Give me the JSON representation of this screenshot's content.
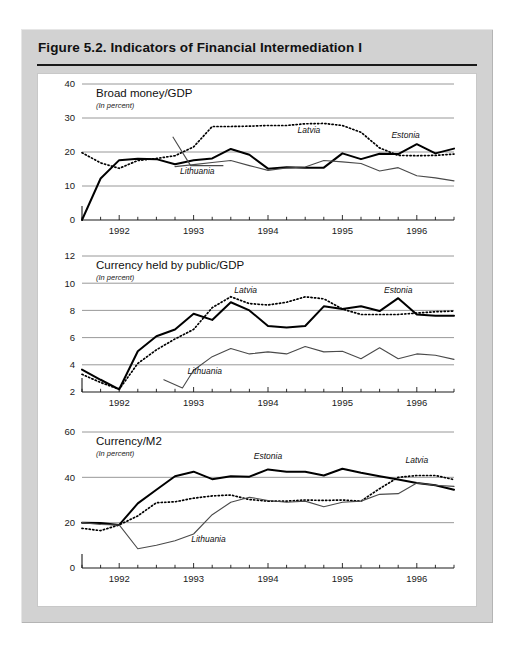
{
  "figure": {
    "title": "Figure 5.2.  Indicators of Financial Intermediation I"
  },
  "chart_data": [
    {
      "type": "line",
      "title": "Broad money/GDP",
      "subtitle": "(In percent)",
      "xlabel": "",
      "ylabel": "",
      "ylim": [
        0,
        40
      ],
      "yticks": [
        0,
        10,
        20,
        30,
        40
      ],
      "ytick_labels": [
        "0",
        "10",
        "20",
        "30",
        "40"
      ],
      "xlim": [
        1991.5,
        1996.5
      ],
      "xticks": [
        1992,
        1993,
        1994,
        1995,
        1996
      ],
      "xtick_labels": [
        "1992",
        "1993",
        "1994",
        "1995",
        "1996"
      ],
      "minor_xticks_per_year": 4,
      "grid": true,
      "legend_position": "inline-annotations",
      "annotations": [
        {
          "text": "Latvia",
          "x": 1994.55,
          "y": 25.6
        },
        {
          "text": "Estonia",
          "x": 1995.85,
          "y": 24.0
        },
        {
          "text": "Lithuania",
          "x": 1993.05,
          "y": 13.6
        }
      ],
      "series": [
        {
          "name": "Estonia",
          "style": "solid-thick",
          "x": [
            1991.5,
            1991.75,
            1992.0,
            1992.25,
            1992.5,
            1992.75,
            1993.0,
            1993.25,
            1993.5,
            1993.75,
            1994.0,
            1994.25,
            1994.5,
            1994.75,
            1995.0,
            1995.25,
            1995.5,
            1995.75,
            1996.0,
            1996.25,
            1996.5
          ],
          "y": [
            0.0,
            12.2,
            17.6,
            18.0,
            17.9,
            16.4,
            17.6,
            18.1,
            20.9,
            19.2,
            15.1,
            15.5,
            15.4,
            15.4,
            19.6,
            17.9,
            19.5,
            19.4,
            22.3,
            19.6,
            21.0
          ]
        },
        {
          "name": "Latvia",
          "style": "dotted",
          "x": [
            1991.5,
            1991.75,
            1992.0,
            1992.25,
            1992.5,
            1992.75,
            1993.0,
            1993.25,
            1993.5,
            1993.75,
            1994.0,
            1994.25,
            1994.5,
            1994.75,
            1995.0,
            1995.25,
            1995.5,
            1995.75,
            1996.0,
            1996.25,
            1996.5
          ],
          "y": [
            19.8,
            16.8,
            15.2,
            17.5,
            18.1,
            18.9,
            21.5,
            27.5,
            27.5,
            27.6,
            27.8,
            27.8,
            28.3,
            28.4,
            27.8,
            25.8,
            21.2,
            19.0,
            18.9,
            19.0,
            19.4
          ]
        },
        {
          "name": "Lithuania",
          "style": "solid-thin",
          "x": [
            1992.75,
            1993.0,
            1993.25,
            1993.5,
            1993.75,
            1994.0,
            1994.25,
            1994.5,
            1994.75,
            1995.0,
            1995.25,
            1995.5,
            1995.75,
            1996.0,
            1996.25,
            1996.5
          ],
          "y": [
            15.7,
            16.3,
            16.9,
            17.5,
            16.0,
            14.6,
            15.3,
            15.6,
            17.5,
            17.1,
            16.6,
            14.4,
            15.4,
            13.0,
            12.4,
            11.5
          ]
        }
      ]
    },
    {
      "type": "line",
      "title": "Currency held by public/GDP",
      "subtitle": "(In percent)",
      "xlabel": "",
      "ylabel": "",
      "ylim": [
        2,
        12
      ],
      "yticks": [
        2,
        4,
        6,
        8,
        10,
        12
      ],
      "ytick_labels": [
        "2",
        "4",
        "6",
        "8",
        "10",
        "12"
      ],
      "xlim": [
        1991.5,
        1996.5
      ],
      "xticks": [
        1992,
        1993,
        1994,
        1995,
        1996
      ],
      "xtick_labels": [
        "1992",
        "1993",
        "1994",
        "1995",
        "1996"
      ],
      "minor_xticks_per_year": 4,
      "grid": true,
      "legend_position": "inline-annotations",
      "annotations": [
        {
          "text": "Latvia",
          "x": 1993.7,
          "y": 9.25
        },
        {
          "text": "Estonia",
          "x": 1995.75,
          "y": 9.3
        },
        {
          "text": "Lithuania",
          "x": 1993.15,
          "y": 3.3
        }
      ],
      "series": [
        {
          "name": "Estonia",
          "style": "solid-thick",
          "x": [
            1991.5,
            1991.75,
            1992.0,
            1992.25,
            1992.5,
            1992.75,
            1993.0,
            1993.25,
            1993.5,
            1993.75,
            1994.0,
            1994.25,
            1994.5,
            1994.75,
            1995.0,
            1995.25,
            1995.5,
            1995.75,
            1996.0,
            1996.25,
            1996.5
          ],
          "y": [
            3.65,
            2.9,
            2.2,
            5.0,
            6.1,
            6.6,
            7.75,
            7.3,
            8.6,
            8.0,
            6.85,
            6.75,
            6.85,
            8.3,
            8.1,
            8.3,
            7.95,
            8.9,
            7.7,
            7.6,
            7.6
          ]
        },
        {
          "name": "Latvia",
          "style": "dotted",
          "x": [
            1991.5,
            1991.75,
            1992.0,
            1992.25,
            1992.5,
            1992.75,
            1993.0,
            1993.25,
            1993.5,
            1993.75,
            1994.0,
            1994.25,
            1994.5,
            1994.75,
            1995.0,
            1995.25,
            1995.5,
            1995.75,
            1996.0,
            1996.25,
            1996.5
          ],
          "y": [
            3.3,
            2.7,
            2.2,
            4.1,
            5.1,
            5.9,
            6.6,
            8.2,
            9.0,
            8.5,
            8.4,
            8.6,
            9.0,
            8.85,
            8.1,
            7.7,
            7.7,
            7.7,
            7.8,
            7.9,
            7.95
          ]
        },
        {
          "name": "Lithuania",
          "style": "solid-thin",
          "x": [
            1992.6,
            1992.85,
            1993.0,
            1993.25,
            1993.5,
            1993.75,
            1994.0,
            1994.25,
            1994.5,
            1994.75,
            1995.0,
            1995.25,
            1995.5,
            1995.75,
            1996.0,
            1996.25,
            1996.5
          ],
          "y": [
            2.9,
            2.3,
            3.6,
            4.6,
            5.2,
            4.8,
            4.95,
            4.8,
            5.35,
            4.95,
            5.0,
            4.45,
            5.25,
            4.45,
            4.8,
            4.7,
            4.4
          ]
        }
      ]
    },
    {
      "type": "line",
      "title": "Currency/M2",
      "subtitle": "(In percent)",
      "xlabel": "",
      "ylabel": "",
      "ylim": [
        0,
        60
      ],
      "yticks": [
        0,
        20,
        40,
        60
      ],
      "ytick_labels": [
        "0",
        "20",
        "40",
        "60"
      ],
      "xlim": [
        1991.5,
        1996.5
      ],
      "xticks": [
        1992,
        1993,
        1994,
        1995,
        1996
      ],
      "xtick_labels": [
        "1992",
        "1993",
        "1994",
        "1995",
        "1996"
      ],
      "minor_xticks_per_year": 4,
      "grid": true,
      "legend_position": "inline-annotations",
      "annotations": [
        {
          "text": "Estonia",
          "x": 1994.0,
          "y": 48.0
        },
        {
          "text": "Latvia",
          "x": 1996.0,
          "y": 46.5
        },
        {
          "text": "Lithuania",
          "x": 1993.2,
          "y": 11.5
        }
      ],
      "series": [
        {
          "name": "Estonia",
          "style": "solid-thick",
          "x": [
            1991.5,
            1991.75,
            1992.0,
            1992.25,
            1992.5,
            1992.75,
            1993.0,
            1993.25,
            1993.5,
            1993.75,
            1994.0,
            1994.25,
            1994.5,
            1994.75,
            1995.0,
            1995.25,
            1995.5,
            1995.75,
            1996.0,
            1996.25,
            1996.5
          ],
          "y": [
            20.0,
            19.8,
            19.0,
            28.5,
            34.5,
            40.5,
            42.5,
            39.2,
            40.5,
            40.3,
            43.5,
            42.5,
            42.5,
            40.8,
            43.8,
            42.0,
            40.5,
            39.0,
            37.5,
            36.5,
            34.5
          ]
        },
        {
          "name": "Latvia",
          "style": "dotted",
          "x": [
            1991.5,
            1991.75,
            1992.0,
            1992.25,
            1992.5,
            1992.75,
            1993.0,
            1993.25,
            1993.5,
            1993.75,
            1994.0,
            1994.25,
            1994.5,
            1994.75,
            1995.0,
            1995.25,
            1995.5,
            1995.75,
            1996.0,
            1996.25,
            1996.5
          ],
          "y": [
            17.5,
            16.5,
            19.0,
            23.0,
            28.8,
            29.2,
            30.8,
            31.8,
            32.2,
            30.2,
            29.5,
            29.5,
            30.0,
            29.8,
            30.0,
            29.5,
            35.0,
            40.0,
            40.8,
            40.8,
            39.0
          ]
        },
        {
          "name": "Lithuania",
          "style": "solid-thin",
          "x": [
            1991.5,
            1991.75,
            1992.0,
            1992.25,
            1992.5,
            1992.75,
            1993.0,
            1993.25,
            1993.5,
            1993.75,
            1994.0,
            1994.25,
            1994.5,
            1994.75,
            1995.0,
            1995.25,
            1995.5,
            1995.75,
            1996.0,
            1996.25,
            1996.5
          ],
          "y": [
            20.0,
            19.2,
            19.0,
            8.5,
            10.0,
            12.0,
            15.0,
            23.5,
            29.0,
            31.2,
            29.8,
            29.0,
            29.5,
            27.0,
            29.0,
            29.5,
            32.5,
            32.8,
            37.5,
            36.5,
            36.0
          ]
        }
      ]
    }
  ]
}
